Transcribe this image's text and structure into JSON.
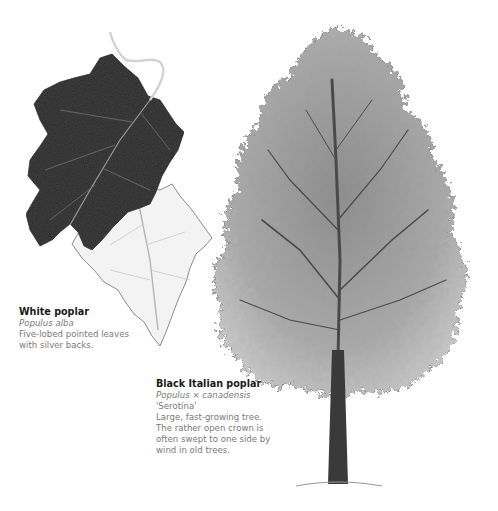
{
  "illustration": {
    "leaves_subject": "white-poplar-leaves",
    "tree_subject": "black-italian-poplar-tree",
    "colors": {
      "background": "#ffffff",
      "dark_leaf": "#3e3e3e",
      "light_leaf": "#f2f2f2",
      "foliage": "#9a9a9a",
      "trunk": "#3a3a3a",
      "title_text": "#1a1a1a",
      "body_text": "#7a7a7a"
    }
  },
  "captions": {
    "white_poplar": {
      "title": "White poplar",
      "latin": "Populus alba",
      "description_lines": [
        "Five-lobed pointed leaves",
        "with silver backs."
      ]
    },
    "black_italian_poplar": {
      "title": "Black Italian poplar",
      "latin": "Populus × canadensis",
      "cultivar": "'Serotina'",
      "description_lines": [
        "Large, fast-growing tree.",
        "The rather open crown is",
        "often swept to one side by",
        "wind in old trees."
      ]
    }
  }
}
